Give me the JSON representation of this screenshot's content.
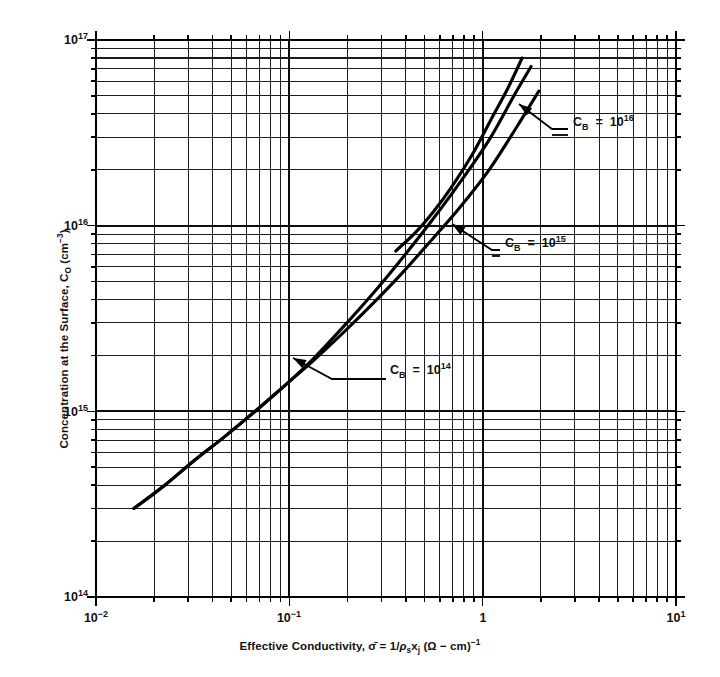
{
  "chart_data": {
    "type": "line",
    "title": "",
    "xlabel": "Effective Conductivity, σ̄ = 1/ρs xj (Ω − cm)⁻¹",
    "ylabel": "Concentration at the Surface, CO (cm⁻³)",
    "xscale": "log",
    "yscale": "log",
    "xlim": [
      0.01,
      10
    ],
    "ylim": [
      100000000000000.0,
      1e+17
    ],
    "grid": true,
    "grid_minor": true,
    "legend_position": "inline-annotations",
    "xticklabels": [
      "10⁻²",
      "10⁻¹",
      "1",
      "10¹"
    ],
    "xtickvalues": [
      0.01,
      0.1,
      1,
      10
    ],
    "yticklabels": [
      "10¹⁴",
      "10¹⁵",
      "10¹⁶",
      "10¹⁷"
    ],
    "ytickvalues": [
      100000000000000.0,
      1000000000000000.0,
      1e+16,
      1e+17
    ],
    "series": [
      {
        "name": "C_B = 10^14",
        "label_base": "C",
        "label_sub": "B",
        "label_eq": "=",
        "label_mantissa": "10",
        "label_exp": "14",
        "x": [
          0.0157,
          0.022,
          0.032,
          0.047,
          0.068,
          0.095,
          0.135,
          0.19,
          0.27,
          0.38,
          0.54,
          0.76,
          1.08,
          1.5,
          1.95
        ],
        "y": [
          300000000000000.0,
          390000000000000.0,
          540000000000000.0,
          740000000000000.0,
          1020000000000000.0,
          1380000000000000.0,
          1900000000000000.0,
          2650000000000000.0,
          3800000000000000.0,
          5500000000000000.0,
          8300000000000000.0,
          1.25e+16,
          2e+16,
          3.4e+16,
          5.3e+16
        ]
      },
      {
        "name": "C_B = 10^15",
        "label_base": "C",
        "label_sub": "B",
        "label_eq": "=",
        "label_mantissa": "10",
        "label_exp": "15",
        "x": [
          0.0157,
          0.022,
          0.032,
          0.047,
          0.068,
          0.095,
          0.135,
          0.19,
          0.27,
          0.38,
          0.54,
          0.76,
          1.08,
          1.45,
          1.78
        ],
        "y": [
          300000000000000.0,
          390000000000000.0,
          540000000000000.0,
          740000000000000.0,
          1020000000000000.0,
          1380000000000000.0,
          1950000000000000.0,
          2850000000000000.0,
          4300000000000000.0,
          6600000000000000.0,
          1.05e+16,
          1.7e+16,
          2.9e+16,
          5e+16,
          7.2e+16
        ]
      },
      {
        "name": "C_B = 10^16",
        "label_base": "C",
        "label_sub": "B",
        "label_eq": "=",
        "label_mantissa": "10",
        "label_exp": "16",
        "x": [
          0.355,
          0.45,
          0.56,
          0.7,
          0.88,
          1.1,
          1.35,
          1.6
        ],
        "y": [
          7300000000000000.0,
          9200000000000000.0,
          1.2e+16,
          1.65e+16,
          2.4e+16,
          3.7e+16,
          5.5e+16,
          8e+16
        ]
      }
    ],
    "annotations": [
      {
        "name": "annotation-cb-1e14",
        "text": "C_B = 10^14",
        "label_x": 390,
        "label_y": 370
      },
      {
        "name": "annotation-cb-1e15",
        "text": "C_B = 10^15",
        "label_x": 505,
        "label_y": 243
      },
      {
        "name": "annotation-cb-1e16",
        "text": "C_B = 10^16",
        "label_x": 573,
        "label_y": 122
      }
    ],
    "colors": {
      "curve": "#000000",
      "grid": "#1a1a1a",
      "axis": "#000000",
      "text": "#111111",
      "background": "#ffffff"
    }
  },
  "axes": {
    "x_title_parts": {
      "lead": "Effective Conductivity,",
      "sigma": "σ̄",
      "eq": "=",
      "expr": "1/",
      "rho": "ρ",
      "rho_sub": "s",
      "x_var": "x",
      "x_sub": "j",
      "unit_open": "(Ω − cm)",
      "unit_exp": "−1"
    },
    "y_title_parts": {
      "lead": "Concentration at the Surface, C",
      "sub": "O",
      "unit": "(cm",
      "unit_exp": "−3",
      "unit_close": ")"
    },
    "x_ticks": [
      {
        "value": 0.01,
        "mantissa": "10",
        "exp": "−2",
        "px": 96
      },
      {
        "value": 0.1,
        "mantissa": "10",
        "exp": "−1",
        "px": 289
      },
      {
        "value": 1,
        "mantissa": "1",
        "exp": "",
        "px": 483
      },
      {
        "value": 10,
        "mantissa": "10",
        "exp": "1",
        "px": 676
      }
    ],
    "y_ticks": [
      {
        "value": 1e+17,
        "mantissa": "10",
        "exp": "17",
        "px": 40
      },
      {
        "value": 1e+16,
        "mantissa": "10",
        "exp": "16",
        "px": 226
      },
      {
        "value": 1000000000000000.0,
        "mantissa": "10",
        "exp": "15",
        "px": 412
      },
      {
        "value": 100000000000000.0,
        "mantissa": "10",
        "exp": "14",
        "px": 597
      }
    ]
  }
}
